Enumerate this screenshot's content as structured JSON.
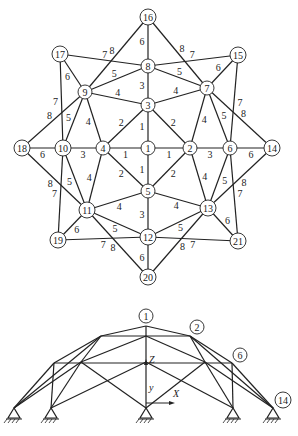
{
  "plan": {
    "nodes": [
      {
        "id": "16",
        "x": 148,
        "y": 17
      },
      {
        "id": "8",
        "x": 148,
        "y": 66
      },
      {
        "id": "3",
        "x": 148,
        "y": 105
      },
      {
        "id": "1",
        "x": 148,
        "y": 148
      },
      {
        "id": "5",
        "x": 148,
        "y": 191
      },
      {
        "id": "12",
        "x": 148,
        "y": 237
      },
      {
        "id": "20",
        "x": 148,
        "y": 277
      },
      {
        "id": "17",
        "x": 60,
        "y": 54
      },
      {
        "id": "9",
        "x": 85,
        "y": 92
      },
      {
        "id": "15",
        "x": 238,
        "y": 55
      },
      {
        "id": "7",
        "x": 207,
        "y": 88
      },
      {
        "id": "18",
        "x": 22,
        "y": 148
      },
      {
        "id": "10",
        "x": 63,
        "y": 148
      },
      {
        "id": "4",
        "x": 103,
        "y": 148
      },
      {
        "id": "2",
        "x": 190,
        "y": 148
      },
      {
        "id": "6",
        "x": 230,
        "y": 148
      },
      {
        "id": "14",
        "x": 272,
        "y": 148
      },
      {
        "id": "11",
        "x": 87,
        "y": 210
      },
      {
        "id": "19",
        "x": 58,
        "y": 240
      },
      {
        "id": "13",
        "x": 208,
        "y": 208
      },
      {
        "id": "21",
        "x": 238,
        "y": 241
      }
    ],
    "members": [
      {
        "a": "16",
        "b": "8",
        "label": "6"
      },
      {
        "a": "8",
        "b": "3",
        "label": "3"
      },
      {
        "a": "3",
        "b": "1",
        "label": "1"
      },
      {
        "a": "1",
        "b": "5",
        "label": "1"
      },
      {
        "a": "5",
        "b": "12",
        "label": "3"
      },
      {
        "a": "12",
        "b": "20",
        "label": "6"
      },
      {
        "a": "18",
        "b": "10",
        "label": "6"
      },
      {
        "a": "10",
        "b": "4",
        "label": "3"
      },
      {
        "a": "4",
        "b": "1",
        "label": "1"
      },
      {
        "a": "1",
        "b": "2",
        "label": "1"
      },
      {
        "a": "2",
        "b": "6",
        "label": "3"
      },
      {
        "a": "6",
        "b": "14",
        "label": "6"
      },
      {
        "a": "3",
        "b": "4",
        "label": "2"
      },
      {
        "a": "3",
        "b": "2",
        "label": "2"
      },
      {
        "a": "4",
        "b": "5",
        "label": "2"
      },
      {
        "a": "2",
        "b": "5",
        "label": "2"
      },
      {
        "a": "9",
        "b": "3",
        "label": "4"
      },
      {
        "a": "7",
        "b": "3",
        "label": "4"
      },
      {
        "a": "9",
        "b": "4",
        "label": "4"
      },
      {
        "a": "7",
        "b": "2",
        "label": "4"
      },
      {
        "a": "11",
        "b": "4",
        "label": "4"
      },
      {
        "a": "11",
        "b": "5",
        "label": "4"
      },
      {
        "a": "13",
        "b": "2",
        "label": "4"
      },
      {
        "a": "13",
        "b": "5",
        "label": "4"
      },
      {
        "a": "9",
        "b": "8",
        "label": "5"
      },
      {
        "a": "7",
        "b": "8",
        "label": "5"
      },
      {
        "a": "9",
        "b": "10",
        "label": "5"
      },
      {
        "a": "7",
        "b": "6",
        "label": "5"
      },
      {
        "a": "11",
        "b": "10",
        "label": "5"
      },
      {
        "a": "11",
        "b": "12",
        "label": "5"
      },
      {
        "a": "13",
        "b": "6",
        "label": "5"
      },
      {
        "a": "13",
        "b": "12",
        "label": "5"
      },
      {
        "a": "17",
        "b": "9",
        "label": "6"
      },
      {
        "a": "15",
        "b": "7",
        "label": "6"
      },
      {
        "a": "19",
        "b": "11",
        "label": "6"
      },
      {
        "a": "21",
        "b": "13",
        "label": "6"
      },
      {
        "a": "17",
        "b": "8",
        "label": "7"
      },
      {
        "a": "15",
        "b": "8",
        "label": "7"
      },
      {
        "a": "17",
        "b": "10",
        "label": "7"
      },
      {
        "a": "15",
        "b": "6",
        "label": "7"
      },
      {
        "a": "19",
        "b": "10",
        "label": "7"
      },
      {
        "a": "21",
        "b": "6",
        "label": "7"
      },
      {
        "a": "19",
        "b": "12",
        "label": "7"
      },
      {
        "a": "21",
        "b": "12",
        "label": "7"
      },
      {
        "a": "16",
        "b": "9",
        "label": "8"
      },
      {
        "a": "16",
        "b": "7",
        "label": "8"
      },
      {
        "a": "18",
        "b": "9",
        "label": "8"
      },
      {
        "a": "14",
        "b": "7",
        "label": "8"
      },
      {
        "a": "18",
        "b": "11",
        "label": "8"
      },
      {
        "a": "14",
        "b": "13",
        "label": "8"
      },
      {
        "a": "20",
        "b": "11",
        "label": "8"
      },
      {
        "a": "20",
        "b": "13",
        "label": "8"
      }
    ]
  },
  "elevation": {
    "points": {
      "top": [
        146,
        326
      ],
      "r1": [
        190,
        336
      ],
      "l1": [
        101,
        336
      ],
      "c1": [
        146,
        336
      ],
      "r2": [
        232,
        363
      ],
      "l2": [
        54,
        363
      ],
      "ri": [
        205,
        362
      ],
      "li": [
        81,
        362
      ],
      "c2": [
        146,
        362
      ],
      "s1": [
        14,
        408
      ],
      "s2": [
        51,
        408
      ],
      "s3": [
        146,
        408
      ],
      "s4": [
        233,
        408
      ],
      "s5": [
        273,
        408
      ]
    },
    "lines": [
      [
        "top",
        "l1"
      ],
      [
        "top",
        "r1"
      ],
      [
        "l1",
        "r1"
      ],
      [
        "top",
        "c1"
      ],
      [
        "c1",
        "c2"
      ],
      [
        "c2",
        "s3"
      ],
      [
        "l1",
        "l2"
      ],
      [
        "r1",
        "r2"
      ],
      [
        "l2",
        "r2"
      ],
      [
        "l1",
        "li"
      ],
      [
        "r1",
        "ri"
      ],
      [
        "c1",
        "li"
      ],
      [
        "c1",
        "ri"
      ],
      [
        "l2",
        "s1"
      ],
      [
        "l2",
        "s2"
      ],
      [
        "r2",
        "s4"
      ],
      [
        "r2",
        "s5"
      ],
      [
        "li",
        "s1"
      ],
      [
        "li",
        "s2"
      ],
      [
        "ri",
        "s4"
      ],
      [
        "ri",
        "s5"
      ],
      [
        "r1",
        "s5"
      ],
      [
        "l1",
        "s1"
      ],
      [
        "li",
        "s3"
      ],
      [
        "ri",
        "s3"
      ],
      [
        "c2",
        "s2"
      ],
      [
        "c2",
        "s4"
      ]
    ],
    "labels": [
      {
        "text": "1",
        "x": 146,
        "y": 316
      },
      {
        "text": "2",
        "x": 197,
        "y": 327
      },
      {
        "text": "6",
        "x": 240,
        "y": 355
      },
      {
        "text": "14",
        "x": 283,
        "y": 400
      }
    ],
    "axes": {
      "origin": [
        146,
        403
      ],
      "z_label": "Z",
      "y_label": "y",
      "x_label": "X"
    }
  }
}
